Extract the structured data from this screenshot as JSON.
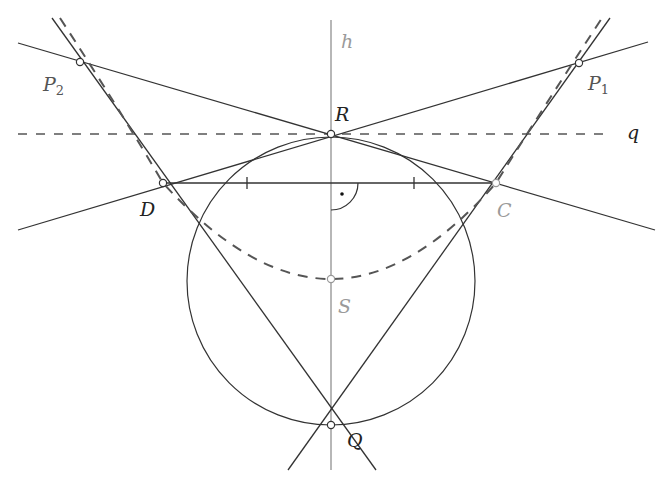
{
  "figure": {
    "colors": {
      "line": "#333333",
      "axis": "#999999",
      "dashed": "#555555",
      "gray_label": "#9a9a9a",
      "point_fill": "#ffffff"
    },
    "labels": {
      "h": "h",
      "q": "q",
      "R": "R",
      "D": "D",
      "C": "C",
      "S": "S",
      "Q": "Q",
      "P2_main": "P",
      "P2_sub": "2",
      "P1_main": "P",
      "P1_sub": "1"
    },
    "points": {
      "R": [
        331,
        134
      ],
      "D": [
        163,
        183
      ],
      "C": [
        496,
        183
      ],
      "S": [
        331,
        279
      ],
      "Q": [
        331,
        425
      ],
      "P1": [
        579,
        63
      ],
      "P2": [
        80,
        62
      ]
    },
    "circle": {
      "cx": 331,
      "cy": 281,
      "r": 144
    },
    "right_angle_mark": "dot"
  }
}
